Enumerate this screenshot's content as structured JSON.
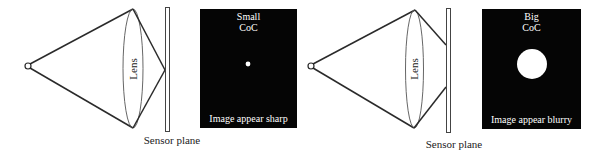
{
  "figure": {
    "panels": [
      {
        "id": "in-focus",
        "lens_label": "Lens",
        "sensor_label": "Sensor plane",
        "coc_title_line1": "Small",
        "coc_title_line2": "CoC",
        "result_caption": "Image appear sharp",
        "coc_size": "small"
      },
      {
        "id": "out-of-focus",
        "lens_label": "Lens",
        "sensor_label": "Sensor plane",
        "coc_title_line1": "Big",
        "coc_title_line2": "CoC",
        "result_caption": "Image appear blurry",
        "coc_size": "big"
      }
    ]
  },
  "colors": {
    "line": "#2a2a2a",
    "panel_bg": "#050505",
    "panel_text": "#ffffff"
  }
}
